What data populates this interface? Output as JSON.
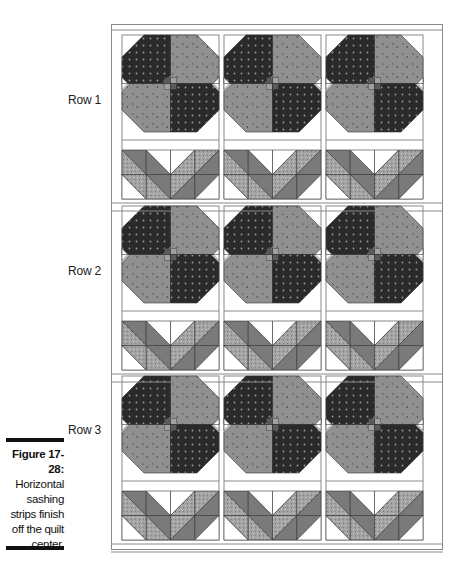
{
  "figure": {
    "number": "Figure 17-28:",
    "caption": "Horizontal sashing strips finish off the quilt center."
  },
  "rows": [
    {
      "label": "Row 1"
    },
    {
      "label": "Row 2"
    },
    {
      "label": "Row 3"
    }
  ],
  "quilt": {
    "columns": 3,
    "rows": 3,
    "block_top": "Flower block (four petals, dark dotted and medium mottled fabrics, checkered center)",
    "block_bottom": "Leaf/V block (half-square triangles)",
    "sashing": "horizontal and vertical white sashing strips",
    "colors": {
      "dark_fabric": "#2b2b2b",
      "medium_fabric": "#8e8e8e",
      "gray_fabric": "#7a7a7a",
      "light_texture": "#a9a9a9",
      "sashing": "#ffffff",
      "outline": "#555555"
    }
  }
}
